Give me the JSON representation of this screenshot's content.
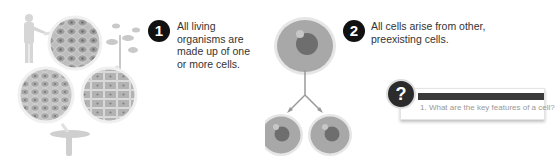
{
  "figure": {
    "top_cutoff_text": "",
    "principles": [
      {
        "number": "1",
        "text_lines": [
          "All living",
          "organisms are",
          "made up of one",
          "or more cells."
        ]
      },
      {
        "number": "2",
        "text_lines": [
          "All cells arise from other,",
          "preexisting cells."
        ]
      }
    ],
    "illustration_left": {
      "description": "organisms (human, plant, mushroom) with magnified cell tissue circles",
      "circles": [
        "animal-tissue",
        "fungal-tissue",
        "plant-tissue"
      ]
    },
    "illustration_right": {
      "description": "one parent cell dividing into two daughter cells",
      "cells": [
        "parent-cell",
        "daughter-cell-left",
        "daughter-cell-right"
      ]
    },
    "question_box": {
      "icon": "?",
      "question": "1. What are the key features of a cell?"
    }
  }
}
